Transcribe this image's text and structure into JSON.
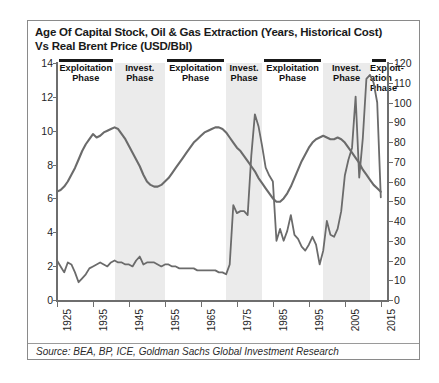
{
  "title": {
    "line1": "Age Of Capital Stock, Oil & Gas Extraction (Years, Historical Cost)",
    "line2": "Vs Real Brent Price (USD/Bbl)"
  },
  "source": "Source: BEA, BP, ICE, Goldman Sachs Global Investment Research",
  "phases": [
    {
      "label": "Exploitation\nPhase",
      "label_l1": "Exploitation",
      "label_l2": "Phase",
      "start": 1925,
      "end": 1941,
      "type": "exploitation"
    },
    {
      "label": "Invest.\nPhase",
      "label_l1": "Invest.",
      "label_l2": "Phase",
      "start": 1941,
      "end": 1955,
      "type": "investment"
    },
    {
      "label": "Exploitation\nPhase",
      "label_l1": "Exploitation",
      "label_l2": "Phase",
      "start": 1955,
      "end": 1972,
      "type": "exploitation"
    },
    {
      "label": "Invest.\nPhase",
      "label_l1": "Invest.",
      "label_l2": "Phase",
      "start": 1972,
      "end": 1982,
      "type": "investment"
    },
    {
      "label": "Exploitation\nPhase",
      "label_l1": "Exploitation",
      "label_l2": "Phase",
      "start": 1982,
      "end": 1999,
      "type": "exploitation"
    },
    {
      "label": "Invest.\nPhase",
      "label_l1": "Invest.",
      "label_l2": "Phase",
      "start": 1999,
      "end": 2012,
      "type": "investment"
    },
    {
      "label": "Exploit-ation Phase",
      "label_l1": "Exploit-",
      "label_l2": "ation",
      "label_l3": "Phase",
      "start": 2012,
      "end": 2017,
      "type": "exploitation"
    }
  ],
  "colors": {
    "line": "#6b6b6b",
    "axis": "#6e6e6e",
    "shaded_band": "#ebebeb",
    "frame": "#8a8a8a",
    "text": "#1a1a1a"
  },
  "chart_data": {
    "type": "line",
    "title": "Age Of Capital Stock, Oil & Gas Extraction (Years, Historical Cost) Vs Real Brent Price (USD/Bbl)",
    "xlabel": "",
    "ylabel": "Age Of Capital Stock (Years, Historical Cost)",
    "y2label": "Real Brent Price (USD/Bbl)",
    "xlim": [
      1925,
      2017
    ],
    "ylim": [
      0,
      14
    ],
    "y2lim": [
      0,
      120
    ],
    "yticks": [
      0,
      2,
      4,
      6,
      8,
      10,
      12,
      14
    ],
    "y2ticks": [
      0,
      10,
      20,
      30,
      40,
      50,
      60,
      70,
      80,
      90,
      100,
      110,
      120
    ],
    "xticks": [
      1925,
      1935,
      1945,
      1955,
      1965,
      1975,
      1985,
      1995,
      2005,
      2015
    ],
    "grid": false,
    "legend": "none",
    "series": [
      {
        "name": "Age Of Capital Stock (Years)",
        "axis": "left",
        "x": [
          1925,
          1926,
          1927,
          1928,
          1929,
          1930,
          1931,
          1932,
          1933,
          1934,
          1935,
          1936,
          1937,
          1938,
          1939,
          1940,
          1941,
          1942,
          1943,
          1944,
          1945,
          1946,
          1947,
          1948,
          1949,
          1950,
          1951,
          1952,
          1953,
          1954,
          1955,
          1956,
          1957,
          1958,
          1959,
          1960,
          1961,
          1962,
          1963,
          1964,
          1965,
          1966,
          1967,
          1968,
          1969,
          1970,
          1971,
          1972,
          1973,
          1974,
          1975,
          1976,
          1977,
          1978,
          1979,
          1980,
          1981,
          1982,
          1983,
          1984,
          1985,
          1986,
          1987,
          1988,
          1989,
          1990,
          1991,
          1992,
          1993,
          1994,
          1995,
          1996,
          1997,
          1998,
          1999,
          2000,
          2001,
          2002,
          2003,
          2004,
          2005,
          2006,
          2007,
          2008,
          2009,
          2010,
          2011,
          2012,
          2013,
          2014,
          2015
        ],
        "values": [
          6.4,
          6.5,
          6.7,
          7.0,
          7.4,
          7.8,
          8.3,
          8.8,
          9.2,
          9.5,
          9.8,
          9.6,
          9.7,
          9.9,
          10.0,
          10.1,
          10.2,
          10.1,
          9.8,
          9.5,
          9.1,
          8.7,
          8.3,
          7.9,
          7.4,
          7.0,
          6.8,
          6.7,
          6.7,
          6.8,
          7.0,
          7.2,
          7.5,
          7.8,
          8.1,
          8.4,
          8.7,
          9.0,
          9.3,
          9.5,
          9.7,
          9.9,
          10.0,
          10.1,
          10.2,
          10.2,
          10.1,
          9.9,
          9.6,
          9.3,
          9.0,
          8.8,
          8.5,
          8.2,
          7.9,
          7.6,
          7.2,
          6.9,
          6.6,
          6.3,
          6.0,
          5.8,
          5.8,
          6.0,
          6.3,
          6.7,
          7.2,
          7.7,
          8.2,
          8.6,
          9.0,
          9.3,
          9.5,
          9.6,
          9.7,
          9.6,
          9.5,
          9.5,
          9.6,
          9.5,
          9.3,
          9.0,
          8.7,
          8.4,
          8.1,
          7.7,
          7.4,
          7.1,
          6.8,
          6.6,
          6.4
        ]
      },
      {
        "name": "Real Brent Price (USD/Bbl)",
        "axis": "right",
        "x": [
          1925,
          1926,
          1927,
          1928,
          1929,
          1930,
          1931,
          1932,
          1933,
          1934,
          1935,
          1936,
          1937,
          1938,
          1939,
          1940,
          1941,
          1942,
          1943,
          1944,
          1945,
          1946,
          1947,
          1948,
          1949,
          1950,
          1951,
          1952,
          1953,
          1954,
          1955,
          1956,
          1957,
          1958,
          1959,
          1960,
          1961,
          1962,
          1963,
          1964,
          1965,
          1966,
          1967,
          1968,
          1969,
          1970,
          1971,
          1972,
          1973,
          1974,
          1975,
          1976,
          1977,
          1978,
          1979,
          1980,
          1981,
          1982,
          1983,
          1984,
          1985,
          1986,
          1987,
          1988,
          1989,
          1990,
          1991,
          1992,
          1993,
          1994,
          1995,
          1996,
          1997,
          1998,
          1999,
          2000,
          2001,
          2002,
          2003,
          2004,
          2005,
          2006,
          2007,
          2008,
          2009,
          2010,
          2011,
          2012,
          2013,
          2014,
          2015
        ],
        "values": [
          20,
          17,
          14,
          19,
          18,
          14,
          9,
          11,
          13,
          16,
          17,
          18,
          19,
          18,
          17,
          19,
          20,
          19,
          19,
          18,
          18,
          17,
          20,
          22,
          18,
          19,
          19,
          19,
          18,
          17,
          18,
          18,
          17,
          17,
          16,
          16,
          16,
          16,
          16,
          15,
          15,
          15,
          15,
          15,
          15,
          14,
          14,
          13,
          18,
          48,
          44,
          45,
          45,
          43,
          73,
          94,
          88,
          78,
          67,
          63,
          60,
          30,
          36,
          30,
          35,
          43,
          33,
          31,
          27,
          25,
          28,
          32,
          28,
          18,
          25,
          40,
          33,
          32,
          36,
          45,
          63,
          71,
          77,
          103,
          62,
          82,
          112,
          114,
          110,
          100,
          52
        ]
      }
    ]
  }
}
